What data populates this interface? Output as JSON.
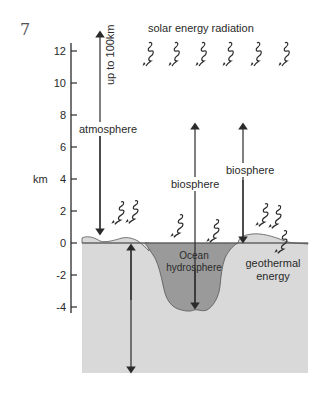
{
  "figure_number": "7",
  "axis": {
    "unit_label": "km",
    "ticks": [
      {
        "value": "12",
        "y": 51
      },
      {
        "value": "10",
        "y": 83
      },
      {
        "value": "8",
        "y": 115
      },
      {
        "value": "6",
        "y": 147
      },
      {
        "value": "4",
        "y": 179
      },
      {
        "value": "2",
        "y": 211
      },
      {
        "value": "0",
        "y": 243
      },
      {
        "value": "-2",
        "y": 275
      },
      {
        "value": "-4",
        "y": 307
      }
    ]
  },
  "labels": {
    "solar": "solar energy radiation",
    "up_to": "up to 100km",
    "atmosphere": "atmosphere",
    "biosphere_ocean": "biosphere",
    "biosphere_land": "biosphere",
    "ocean_line1": "Ocean",
    "ocean_line2": "hydrosphere",
    "geothermal_line1": "geothermal",
    "geothermal_line2": "energy"
  },
  "colors": {
    "earth": "#d9d9d9",
    "ocean": "#9a9a9a",
    "line": "#2a2a2a"
  }
}
